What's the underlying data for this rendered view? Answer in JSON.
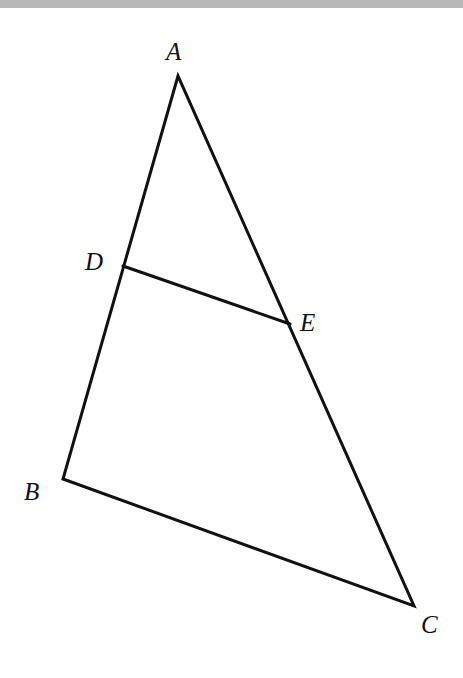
{
  "figure": {
    "type": "geometry-triangle",
    "points": {
      "A": {
        "label": "A",
        "x": 178,
        "y": 76,
        "label_x": 166,
        "label_y": 60
      },
      "B": {
        "label": "B",
        "x": 63,
        "y": 479,
        "label_x": 24,
        "label_y": 500
      },
      "C": {
        "label": "C",
        "x": 414,
        "y": 606,
        "label_x": 421,
        "label_y": 633
      },
      "D": {
        "label": "D",
        "x": 123,
        "y": 266,
        "label_x": 85,
        "label_y": 270
      },
      "E": {
        "label": "E",
        "x": 290,
        "y": 324,
        "label_x": 300,
        "label_y": 331
      }
    },
    "segments": [
      {
        "from": "A",
        "to": "B"
      },
      {
        "from": "B",
        "to": "C"
      },
      {
        "from": "C",
        "to": "A"
      },
      {
        "from": "D",
        "to": "E"
      }
    ],
    "stroke_color": "#111111",
    "header_band_color": "#b9b9b9"
  }
}
